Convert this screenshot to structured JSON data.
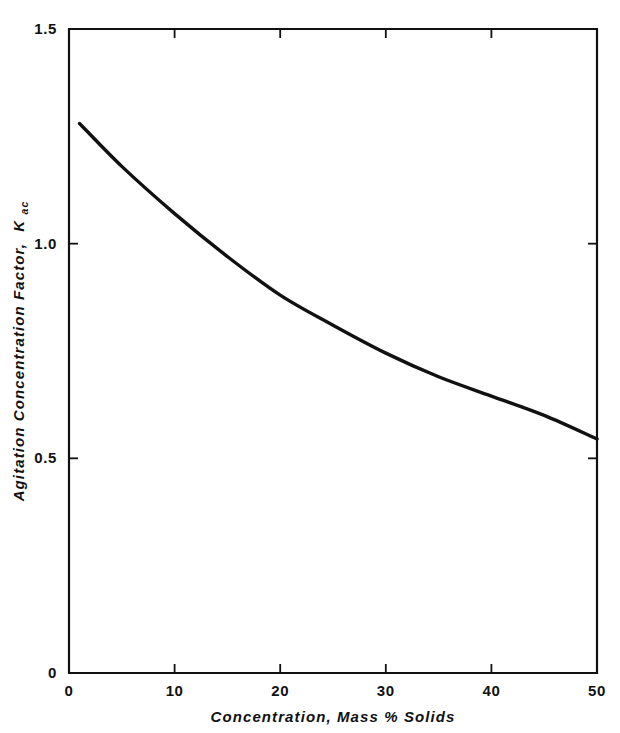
{
  "chart_data": {
    "type": "line",
    "title": "",
    "xlabel": "Concentration, Mass % Solids",
    "ylabel_main": "Agitation Concentration Factor,",
    "ylabel_symbol": "K",
    "ylabel_subscript": "ac",
    "xlim": [
      0,
      50
    ],
    "ylim": [
      0,
      1.5
    ],
    "grid": false,
    "legend": "none",
    "xticks": [
      "0",
      "10",
      "20",
      "30",
      "40",
      "50"
    ],
    "xtick_values": [
      0,
      10,
      20,
      30,
      40,
      50
    ],
    "yticks": [
      "0",
      "0.5",
      "1.0",
      "1.5"
    ],
    "ytick_values": [
      0,
      0.5,
      1.0,
      1.5
    ],
    "series": [
      {
        "name": "Agitation Concentration Factor",
        "x": [
          1,
          5,
          10,
          15,
          20,
          25,
          30,
          35,
          40,
          45,
          50
        ],
        "values": [
          1.28,
          1.18,
          1.07,
          0.97,
          0.88,
          0.81,
          0.745,
          0.69,
          0.645,
          0.6,
          0.545
        ]
      }
    ],
    "line_color": "#111111",
    "axis_color": "#111111",
    "background_color": "#ffffff"
  }
}
